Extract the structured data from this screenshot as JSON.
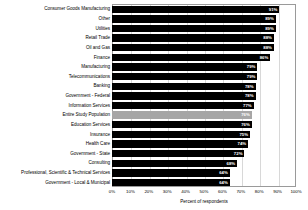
{
  "chart_data": {
    "type": "bar",
    "orientation": "horizontal",
    "title": "",
    "xlabel": "Percent of respondents",
    "ylabel": "",
    "xlim": [
      0,
      100
    ],
    "grid": true,
    "legend": "none",
    "xticks": [
      "0%",
      "10%",
      "20%",
      "30%",
      "40%",
      "50%",
      "60%",
      "70%",
      "80%",
      "90%",
      "100%"
    ],
    "xtick_values": [
      0,
      10,
      20,
      30,
      40,
      50,
      60,
      70,
      80,
      90,
      100
    ],
    "highlight_category": "Entire Study Population",
    "colors": {
      "bar": "#000000",
      "highlight_bar": "#a6a6a6",
      "value_label": "#ffffff",
      "gridline": "#d8d8d8",
      "plot_border": "#9a9a9a",
      "background": "#ffffff",
      "text": "#000000"
    },
    "categories": [
      "Consumer Goods Manufacturing",
      "Other",
      "Utilities",
      "Retail Trade",
      "Oil and Gas",
      "Finance",
      "Manufacturing",
      "Telecommunications",
      "Banking",
      "Government - Federal",
      "Information Services",
      "Entire Study Population",
      "Education Services",
      "Insurance",
      "Health Care",
      "Government - State",
      "Consulting",
      "Professional, Scientific & Technical Services",
      "Government - Local & Municipal"
    ],
    "values": [
      91,
      89,
      89,
      88,
      88,
      86,
      79,
      79,
      78,
      78,
      77,
      76,
      76,
      75,
      74,
      72,
      68,
      64,
      64
    ],
    "value_labels": [
      "91%",
      "89%",
      "89%",
      "88%",
      "88%",
      "86%",
      "79%",
      "79%",
      "78%",
      "78%",
      "77%",
      "76%",
      "76%",
      "75%",
      "74%",
      "72%",
      "68%",
      "64%",
      "64%"
    ]
  }
}
